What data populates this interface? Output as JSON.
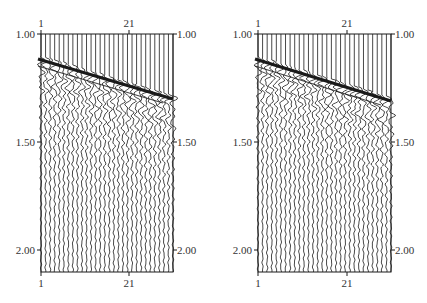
{
  "chart_data": [
    {
      "type": "seismic-wiggle",
      "title": "",
      "xlabel": "Trace number",
      "ylabel": "Time (s)",
      "x_ticks": [
        1,
        21
      ],
      "y_ticks": [
        "1.00",
        "1.50",
        "2.00"
      ],
      "y_range": [
        1.0,
        2.1
      ],
      "trace_count": 30,
      "first_arrival": {
        "trace_1_time": 1.22,
        "trace_30_time": 1.59
      },
      "grid": false,
      "legend": null
    },
    {
      "type": "seismic-wiggle",
      "title": "",
      "xlabel": "Trace number",
      "ylabel": "Time (s)",
      "x_ticks": [
        1,
        21
      ],
      "y_ticks": [
        "1.00",
        "1.50",
        "2.00"
      ],
      "y_range": [
        1.0,
        2.1
      ],
      "trace_count": 30,
      "first_arrival": {
        "trace_1_time": 1.22,
        "trace_30_time": 1.6
      },
      "grid": false,
      "legend": null
    }
  ],
  "panels": [
    {
      "offset_x": 0,
      "frame": {
        "left": 41,
        "right": 173,
        "top": 34,
        "bottom": 272
      },
      "top_ticks": [
        {
          "label": "1",
          "x": 41
        },
        {
          "label": "21",
          "x": 129
        }
      ],
      "bottom_ticks": [
        {
          "label": "1",
          "x": 41
        },
        {
          "label": "21",
          "x": 129
        }
      ],
      "left_ticks": [
        {
          "label": "1.00",
          "y": 34
        },
        {
          "label": "1.50",
          "y": 142
        },
        {
          "label": "2.00",
          "y": 250
        }
      ],
      "right_ticks": [
        {
          "label": "1.00",
          "y": 34
        },
        {
          "label": "1.50",
          "y": 142
        },
        {
          "label": "2.00",
          "y": 250
        }
      ],
      "arrival": {
        "y_start": 59,
        "y_end": 99
      },
      "seed": 7
    },
    {
      "offset_x": 0,
      "frame": {
        "left": 258,
        "right": 391,
        "top": 34,
        "bottom": 272
      },
      "top_ticks": [
        {
          "label": "1",
          "x": 258
        },
        {
          "label": "21",
          "x": 347
        }
      ],
      "bottom_ticks": [
        {
          "label": "1",
          "x": 258
        },
        {
          "label": "21",
          "x": 347
        }
      ],
      "left_ticks": [
        {
          "label": "1.00",
          "y": 34
        },
        {
          "label": "1.50",
          "y": 142
        },
        {
          "label": "2.00",
          "y": 250
        }
      ],
      "right_ticks": [
        {
          "label": "1.00",
          "y": 34
        },
        {
          "label": "1.50",
          "y": 142
        },
        {
          "label": "2.00",
          "y": 250
        }
      ],
      "arrival": {
        "y_start": 59,
        "y_end": 101
      },
      "seed": 13
    }
  ],
  "colors": {
    "ink": "#1a1a1a",
    "text": "#333333",
    "background": "#ffffff"
  }
}
